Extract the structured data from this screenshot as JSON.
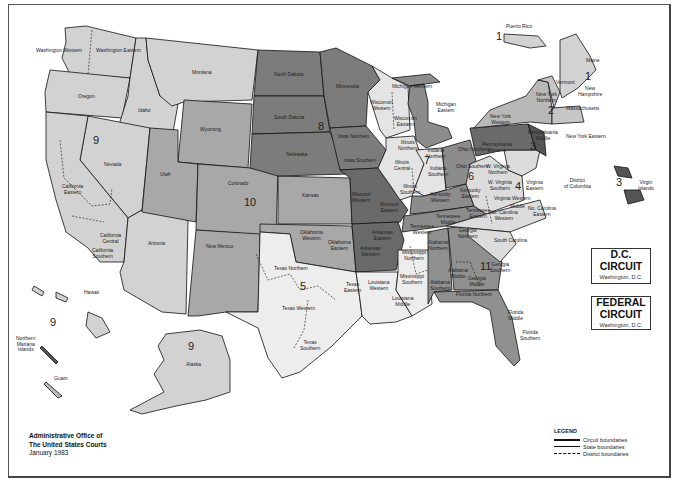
{
  "colors": {
    "light": "#d2d2d2",
    "medium": "#a8a8a8",
    "dark": "#7c7c7c",
    "darker": "#6a6a6a",
    "white_state": "#ededed",
    "border": "#111111"
  },
  "circuit_numbers": {
    "c1_pr": "1",
    "c1": "1",
    "c2": "2",
    "c3": "3",
    "c3_vi": "3",
    "c4": "4",
    "c5": "5",
    "c6": "6",
    "c7": "7",
    "c8": "8",
    "c9": "9",
    "c9_hi": "9",
    "c9_ak": "9",
    "c10": "10",
    "c11": "11"
  },
  "labels": {
    "puerto_rico": "Puerto Rico",
    "virgin_islands": "Virgin\nIslands",
    "hawaii": "Hawaii",
    "northern_mariana": "Northern\nMariana\nIslands",
    "guam": "Guam",
    "alaska": "Alaska",
    "washington_western": "Washington\nWestern",
    "washington_eastern": "Washington\nEastern",
    "oregon": "Oregon",
    "idaho": "Idaho",
    "montana": "Montana",
    "wyoming": "Wyoming",
    "nevada": "Nevada",
    "california_eastern": "California\nEastern",
    "california_central": "California\nCentral",
    "california_southern": "California\nSouthern",
    "california_northern": "California Northern",
    "utah": "Utah",
    "colorado": "Colorado",
    "arizona": "Arizona",
    "new_mexico": "New Mexico",
    "north_dakota": "North Dakota",
    "south_dakota": "South Dakota",
    "nebraska": "Nebraska",
    "kansas": "Kansas",
    "minnesota": "Minnesota",
    "iowa_northern": "Iowa Northern",
    "iowa_southern": "Iowa Southern",
    "missouri_western": "Missouri\nWestern",
    "missouri_eastern": "Missouri\nEastern",
    "arkansas_western": "Arkansas\nWestern",
    "arkansas_eastern": "Arkansas\nEastern",
    "oklahoma_western": "Oklahoma\nWestern",
    "oklahoma_northern": "Oklahoma\nNorthern",
    "oklahoma_eastern": "Oklahoma\nEastern",
    "texas_northern": "Texas Northern",
    "texas_western": "Texas Western",
    "texas_eastern": "Texas\nEastern",
    "texas_southern": "Texas\nSouthern",
    "louisiana_western": "Louisiana\nWestern",
    "louisiana_middle": "Louisiana\nMiddle",
    "louisiana_eastern": "Louisiana\nEastern",
    "mississippi_northern": "Mississippi\nNorthern",
    "mississippi_southern": "Mississippi\nSouthern",
    "wisconsin_western": "Wisconsin\nWestern",
    "wisconsin_eastern": "Wisconsin\nEastern",
    "michigan_western": "Michigan Western",
    "michigan_eastern": "Michigan\nEastern",
    "illinois_northern": "Illinois\nNorthern",
    "illinois_central": "Illinois\nCentral",
    "illinois_southern": "Illinois\nSouthern",
    "indiana_northern": "Indiana\nNorthern",
    "indiana_southern": "Indiana\nSouthern",
    "ohio_northern": "Ohio Northern",
    "ohio_southern": "Ohio Southern",
    "kentucky_western": "Kentucky\nWestern",
    "kentucky_eastern": "Kentucky\nEastern",
    "tennessee_western": "Tennessee\nWestern",
    "tennessee_middle": "Tennessee\nMiddle",
    "tennessee_eastern": "Tennessee\nEastern",
    "alabama_northern": "Alabama\nNorthern",
    "alabama_middle": "Alabama\nMiddle",
    "alabama_southern": "Alabama\nSouthern",
    "georgia_northern": "Georgia\nNorthern",
    "georgia_middle": "Georgia\nMiddle",
    "georgia_southern": "Georgia\nSouthern",
    "florida_northern": "Florida Northern",
    "florida_middle": "Florida\nMiddle",
    "florida_southern": "Florida\nSouthern",
    "south_carolina": "South Carolina",
    "nc_western": "No. Carolina\nWestern",
    "nc_middle": "Middle",
    "nc_eastern": "No. Carolina\nEastern",
    "virginia_western": "Virginia Western",
    "virginia_eastern": "Virginia\nEastern",
    "wv_northern": "W. Virginia\nNorthern",
    "wv_southern": "W. Virginia\nSouthern",
    "dc": "District\nof Columbia",
    "maryland": "Maryland",
    "delaware": "Del.",
    "new_jersey": "New Jersey",
    "pennsylvania_western": "Pennsylvania\nWestern",
    "pennsylvania_middle": "Pennsylvania\nMiddle",
    "pennsylvania_eastern": "Penn.\nEastern",
    "new_york_western": "New York\nWestern",
    "new_york_northern": "New York\nNorthern",
    "new_york_southern": "New York\nSouthern",
    "new_york_eastern": "New York Eastern",
    "vermont": "Vermont",
    "new_hampshire": "New\nHampshire",
    "maine": "Maine",
    "massachusetts": "Massachusetts",
    "connecticut": "Conn.",
    "rhode_island": "R.I."
  },
  "dc_circuit": {
    "title_line1": "D.C.",
    "title_line2": "CIRCUIT",
    "location": "Washington, D.C."
  },
  "federal_circuit": {
    "title_line1": "FEDERAL",
    "title_line2": "CIRCUIT",
    "location": "Washington, D.C."
  },
  "credit": {
    "line1": "Administrative Office of",
    "line2": "The United States Courts",
    "date": "January 1983"
  },
  "legend": {
    "title": "LEGEND",
    "items": [
      {
        "label": "Circuit boundaries",
        "style": "thick-solid"
      },
      {
        "label": "State boundaries",
        "style": "thin-solid"
      },
      {
        "label": "District boundaries",
        "style": "dashed"
      }
    ]
  }
}
